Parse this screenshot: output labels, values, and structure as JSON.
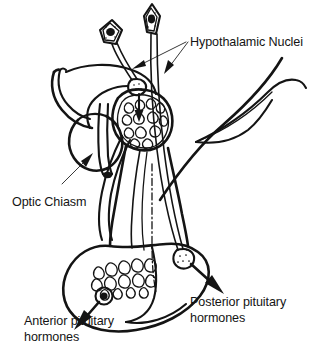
{
  "figure": {
    "style": "black ink line drawing on white",
    "ink_color": "#141414",
    "background_color": "#ffffff",
    "width": 320,
    "height": 354
  },
  "labels": {
    "hypothalamic_nuclei": "Hypothalamic Nuclei",
    "optic_chiasm": "Optic Chiasm",
    "anterior_line1": "Anterior pituitary",
    "anterior_line2": "hormones",
    "posterior_line1": "Posterior pituitary",
    "posterior_line2": "hormones"
  },
  "structures": {
    "neuron_left": "hypothalamic-neuron-soma-left",
    "neuron_right": "hypothalamic-neuron-soma-right",
    "median_eminence": "primary-capillary-plexus",
    "optic_chiasm": "optic-chiasm-lobe",
    "optic_nerve": "optic-nerve",
    "infundibular_stalk": "infundibular-stalk",
    "portal_vessel": "hypophyseal-portal-vein",
    "pituitary_gland": "pituitary-gland-outline",
    "anterior_lobe_plexus": "secondary-capillary-plexus",
    "anterior_cell": "anterior-pituitary-cell",
    "posterior_terminal": "posterior-axon-terminal",
    "brain_outline": "brain-tissue-contour"
  },
  "arrows": {
    "to_neuron_left": "leader-arrow-left-neuron",
    "to_neuron_right": "leader-arrow-right-neuron",
    "to_optic_chiasm": "leader-arrow-optic-chiasm",
    "anterior_release": "anterior-hormone-release-arrow",
    "posterior_release": "posterior-hormone-release-arrow",
    "median_eminence_release": "median-eminence-release-arrow"
  }
}
